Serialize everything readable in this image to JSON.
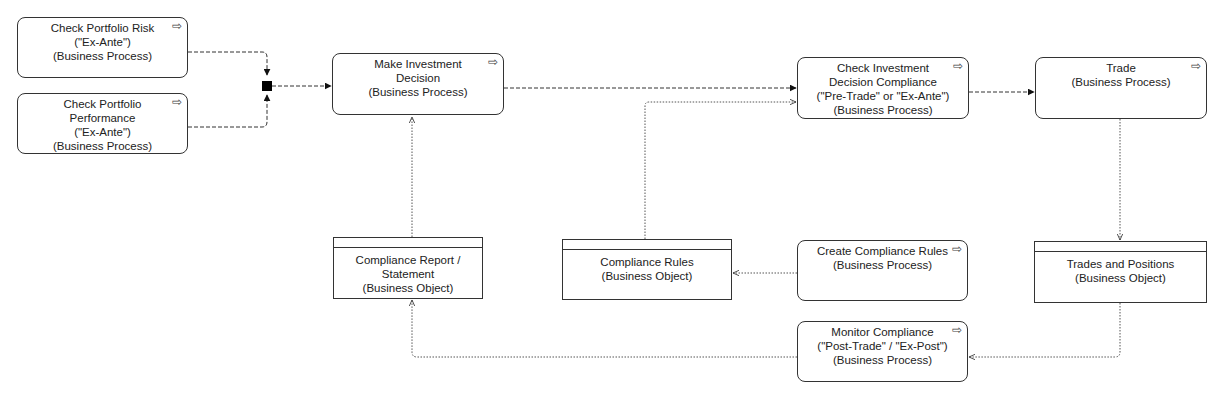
{
  "diagram": {
    "type": "ArchiMate business process flow",
    "nodes": [
      {
        "id": "check_risk",
        "kind": "process",
        "lines": [
          "Check Portfolio Risk",
          "(\"Ex-Ante\")",
          "(Business Process)"
        ],
        "x": 17,
        "y": 17,
        "w": 171,
        "h": 61
      },
      {
        "id": "check_perf",
        "kind": "process",
        "lines": [
          "Check Portfolio",
          "Performance",
          "(\"Ex-Ante\")",
          "(Business Process)"
        ],
        "x": 17,
        "y": 93,
        "w": 171,
        "h": 61
      },
      {
        "id": "make_decision",
        "kind": "process",
        "lines": [
          "Make Investment",
          "Decision",
          "(Business Process)"
        ],
        "x": 332,
        "y": 53,
        "w": 172,
        "h": 62
      },
      {
        "id": "check_compliance",
        "kind": "process",
        "lines": [
          "Check Investment",
          "Decision Compliance",
          "(\"Pre-Trade\" or \"Ex-Ante\")",
          "(Business Process)"
        ],
        "x": 797,
        "y": 57,
        "w": 172,
        "h": 62
      },
      {
        "id": "trade",
        "kind": "process",
        "lines": [
          "Trade",
          "(Business Process)"
        ],
        "x": 1035,
        "y": 57,
        "w": 172,
        "h": 62
      },
      {
        "id": "compliance_report",
        "kind": "object",
        "lines": [
          "Compliance Report / Statement",
          "(Business Object)"
        ],
        "x": 333,
        "y": 237,
        "w": 150,
        "h": 62
      },
      {
        "id": "compliance_rules",
        "kind": "object",
        "lines": [
          "Compliance Rules",
          "(Business Object)"
        ],
        "x": 562,
        "y": 239,
        "w": 170,
        "h": 61
      },
      {
        "id": "create_rules",
        "kind": "process",
        "lines": [
          "Create Compliance Rules",
          "(Business Process)"
        ],
        "x": 797,
        "y": 240,
        "w": 171,
        "h": 61
      },
      {
        "id": "trades_positions",
        "kind": "object",
        "lines": [
          "Trades and Positions",
          "(Business Object)"
        ],
        "x": 1034,
        "y": 241,
        "w": 173,
        "h": 62
      },
      {
        "id": "monitor",
        "kind": "process",
        "lines": [
          "Monitor Compliance",
          "(\"Post-Trade\" / \"Ex-Post\")",
          "(Business Process)"
        ],
        "x": 797,
        "y": 321,
        "w": 171,
        "h": 61
      }
    ],
    "process_icon": "process-arrow-icon ⇨",
    "junction": "and-junction",
    "colors": {
      "stroke": "#333333",
      "background": "#ffffff",
      "text": "#222222"
    }
  }
}
